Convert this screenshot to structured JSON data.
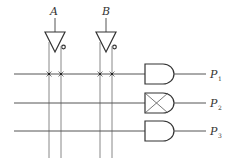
{
  "diagram": {
    "type": "PLA fixed-AND array",
    "inputs": [
      {
        "label": "A",
        "x": 52,
        "true_line_x": 49,
        "comp_line_x": 61
      },
      {
        "label": "B",
        "x": 103,
        "true_line_x": 100,
        "comp_line_x": 112
      }
    ],
    "rows": [
      {
        "y": 74,
        "gate": "AND",
        "output_label": "P",
        "output_sub": "1",
        "connections": [
          true,
          true,
          true,
          true
        ]
      },
      {
        "y": 103,
        "gate": "AND-crossed",
        "output_label": "P",
        "output_sub": "2",
        "connections": [
          false,
          false,
          false,
          false
        ]
      },
      {
        "y": 131,
        "gate": "AND",
        "output_label": "P",
        "output_sub": "3",
        "connections": [
          false,
          false,
          false,
          false
        ]
      }
    ],
    "colors": {
      "line": "#555555",
      "vertical": "#888888",
      "gate": "#333333"
    }
  }
}
